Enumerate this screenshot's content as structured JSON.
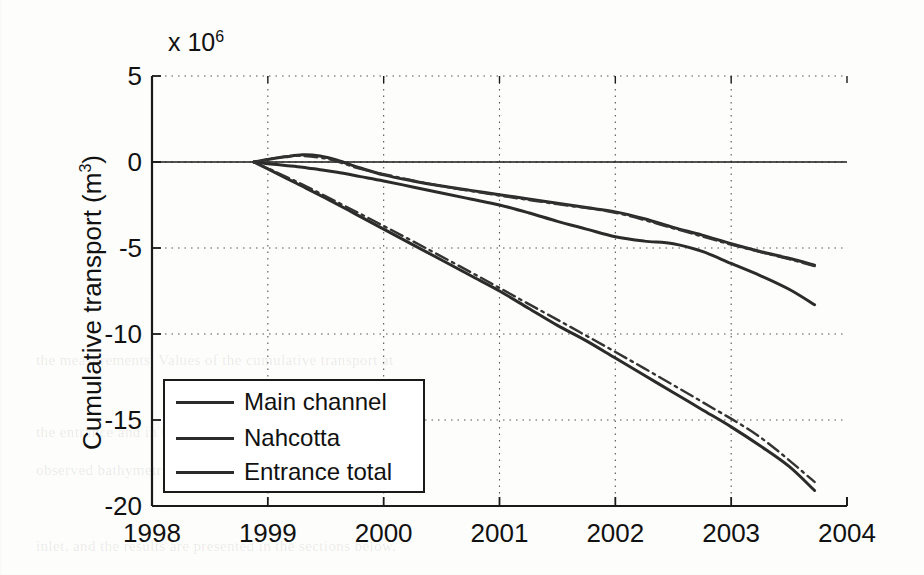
{
  "figure": {
    "exponent_prefix": "x 10",
    "exponent_power": "6",
    "ylabel_text": "Cumulative transport (m",
    "ylabel_sup": "3",
    "ylabel_suffix": ")"
  },
  "legend": {
    "entries": [
      {
        "label": "Main channel",
        "style": "solid",
        "color": "#2b2b2b"
      },
      {
        "label": "Nahcotta",
        "style": "solid",
        "color": "#2b2b2b"
      },
      {
        "label": "Entrance total",
        "style": "solid",
        "color": "#2b2b2b"
      }
    ]
  },
  "background_text": [
    "the measurements. Values of the cumulative transport at",
    "the entrance and in the channels were compared to the",
    "observed bathymetric change in the channels and in the",
    "inlet, and the results are presented in the sections below."
  ],
  "chart_data": {
    "type": "line",
    "title": "",
    "xlabel": "",
    "ylabel": "Cumulative transport (m3)",
    "y_exponent": 1000000,
    "xlim": [
      1998,
      2004
    ],
    "ylim": [
      -20,
      5
    ],
    "xticks": [
      1998,
      1999,
      2000,
      2001,
      2002,
      2003,
      2004
    ],
    "yticks": [
      5,
      0,
      -5,
      -10,
      -15,
      -20
    ],
    "grid": true,
    "grid_style": "dotted",
    "legend_position": "lower-left-inside",
    "series": [
      {
        "name": "Main channel",
        "style": "solid",
        "color": "#2b2b2b",
        "x": [
          1998.88,
          1999.0,
          1999.15,
          1999.3,
          1999.45,
          1999.6,
          1999.8,
          2000.0,
          2000.25,
          2000.5,
          2000.75,
          2001.0,
          2001.25,
          2001.5,
          2001.75,
          2002.0,
          2002.25,
          2002.5,
          2002.75,
          2003.0,
          2003.25,
          2003.5,
          2003.72
        ],
        "y": [
          0.0,
          0.15,
          0.3,
          0.42,
          0.35,
          0.1,
          -0.35,
          -0.75,
          -1.1,
          -1.4,
          -1.65,
          -1.9,
          -2.15,
          -2.4,
          -2.65,
          -2.9,
          -3.3,
          -3.8,
          -4.25,
          -4.75,
          -5.2,
          -5.6,
          -6.0
        ]
      },
      {
        "name": "Nahcotta",
        "style": "solid",
        "color": "#2b2b2b",
        "x": [
          1998.88,
          1999.0,
          1999.15,
          1999.3,
          1999.45,
          1999.6,
          1999.8,
          2000.0,
          2000.25,
          2000.5,
          2000.75,
          2001.0,
          2001.25,
          2001.5,
          2001.75,
          2002.0,
          2002.25,
          2002.5,
          2002.75,
          2003.0,
          2003.25,
          2003.5,
          2003.72
        ],
        "y": [
          0.0,
          -0.1,
          -0.2,
          -0.3,
          -0.45,
          -0.6,
          -0.85,
          -1.1,
          -1.45,
          -1.8,
          -2.15,
          -2.5,
          -2.95,
          -3.45,
          -3.9,
          -4.35,
          -4.6,
          -4.75,
          -5.2,
          -5.9,
          -6.6,
          -7.4,
          -8.3
        ]
      },
      {
        "name": "Entrance total",
        "style": "solid",
        "color": "#2b2b2b",
        "x": [
          1998.88,
          1999.0,
          1999.25,
          1999.5,
          1999.75,
          2000.0,
          2000.25,
          2000.5,
          2000.75,
          2001.0,
          2001.25,
          2001.5,
          2001.75,
          2002.0,
          2002.25,
          2002.5,
          2002.75,
          2003.0,
          2003.25,
          2003.5,
          2003.72
        ],
        "y": [
          0.0,
          -0.4,
          -1.25,
          -2.1,
          -3.0,
          -3.9,
          -4.8,
          -5.7,
          -6.6,
          -7.5,
          -8.5,
          -9.5,
          -10.4,
          -11.4,
          -12.4,
          -13.4,
          -14.4,
          -15.4,
          -16.5,
          -17.7,
          -19.1
        ]
      },
      {
        "name": "Main channel (model)",
        "style": "dashdot",
        "color": "#333333",
        "x": [
          1998.88,
          1999.2,
          1999.5,
          1999.8,
          2000.1,
          2000.5,
          2001.0,
          2001.5,
          2002.0,
          2002.5,
          2003.0,
          2003.5,
          2003.72
        ],
        "y": [
          0.0,
          0.35,
          0.2,
          -0.4,
          -0.85,
          -1.4,
          -1.95,
          -2.45,
          -2.95,
          -3.85,
          -4.8,
          -5.65,
          -6.05
        ]
      },
      {
        "name": "Entrance total (model)",
        "style": "dashdot",
        "color": "#333333",
        "x": [
          1998.88,
          1999.25,
          1999.75,
          2000.25,
          2000.75,
          2001.25,
          2001.75,
          2002.25,
          2002.75,
          2003.25,
          2003.72
        ],
        "y": [
          0.0,
          -1.15,
          -2.85,
          -4.6,
          -6.4,
          -8.25,
          -10.1,
          -12.0,
          -13.95,
          -16.0,
          -18.6
        ]
      }
    ]
  }
}
